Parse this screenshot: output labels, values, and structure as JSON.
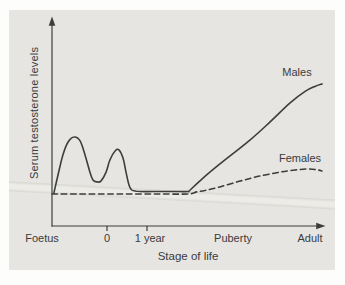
{
  "figure": {
    "panel_bg": "#e6e5e2",
    "ink_color": "#3d3d3d",
    "band_color": "#c1c1ba"
  },
  "chart_data": {
    "type": "line",
    "title": "",
    "xlabel": "Stage of life",
    "ylabel": "Serum testosterone levels",
    "x_tick_labels": [
      "Foetus",
      "0",
      "1 year",
      "Puberty",
      "Adult"
    ],
    "x_axis_tick_marks_at": [
      "0",
      "1 year"
    ],
    "y_axis_ticks": "none",
    "y_range_relative": [
      0,
      100
    ],
    "grid": false,
    "legend_position": "inline-annotations",
    "series": [
      {
        "name": "Males",
        "line_style": "solid",
        "description": "Two prenatal/neonatal peaks, low flat childhood level, steep rise at puberty to high adult plateau",
        "points": [
          [
            0.7,
            15.8
          ],
          [
            2.2,
            24.4
          ],
          [
            4.0,
            34.0
          ],
          [
            5.9,
            40.2
          ],
          [
            8.1,
            42.6
          ],
          [
            10.3,
            40.7
          ],
          [
            12.1,
            34.0
          ],
          [
            13.9,
            25.8
          ],
          [
            15.0,
            22.0
          ],
          [
            16.5,
            21.1
          ],
          [
            17.9,
            21.5
          ],
          [
            19.8,
            25.8
          ],
          [
            21.2,
            31.6
          ],
          [
            23.1,
            35.9
          ],
          [
            24.5,
            36.4
          ],
          [
            26.0,
            32.5
          ],
          [
            27.1,
            25.8
          ],
          [
            28.2,
            19.6
          ],
          [
            29.3,
            17.2
          ],
          [
            32.2,
            16.5
          ],
          [
            39.6,
            16.5
          ],
          [
            44.5,
            16.5
          ],
          [
            49.8,
            16.5
          ],
          [
            50.4,
            17.0
          ],
          [
            55.0,
            22.6
          ],
          [
            61.5,
            29.7
          ],
          [
            72.5,
            41.1
          ],
          [
            79.9,
            49.8
          ],
          [
            87.2,
            58.9
          ],
          [
            92.7,
            64.4
          ],
          [
            96.3,
            66.8
          ],
          [
            98.9,
            68.0
          ]
        ]
      },
      {
        "name": "Females",
        "line_style": "dashed",
        "description": "Flat low level through childhood, slight rise at puberty to a low adult plateau",
        "points": [
          [
            0,
            15.3
          ],
          [
            10,
            15.3
          ],
          [
            20,
            15.3
          ],
          [
            30,
            15.3
          ],
          [
            40,
            15.3
          ],
          [
            49.8,
            15.3
          ],
          [
            53.0,
            16.3
          ],
          [
            56.0,
            17.0
          ],
          [
            61.5,
            18.7
          ],
          [
            68.9,
            21.5
          ],
          [
            76.2,
            23.9
          ],
          [
            83.5,
            25.8
          ],
          [
            89.0,
            26.8
          ],
          [
            93.8,
            27.3
          ],
          [
            97.4,
            26.8
          ],
          [
            98.9,
            26.3
          ]
        ]
      }
    ]
  }
}
